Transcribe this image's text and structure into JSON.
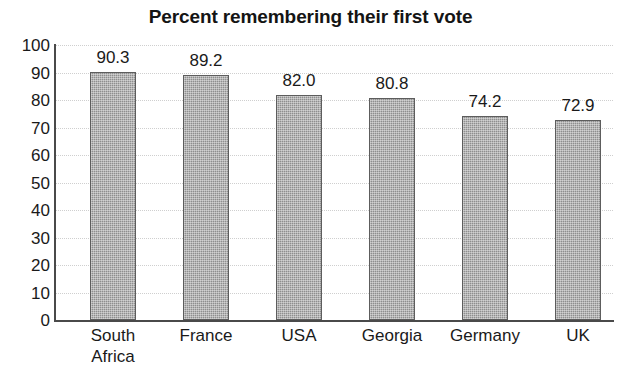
{
  "chart_data": {
    "type": "bar",
    "title": "Percent remembering their first vote",
    "xlabel": "",
    "ylabel": "",
    "ylim": [
      0,
      100
    ],
    "ytick_step": 10,
    "yticks": [
      "100",
      "90",
      "80",
      "70",
      "60",
      "50",
      "40",
      "30",
      "20",
      "10",
      "0"
    ],
    "grid": true,
    "legend": "none",
    "categories": [
      "South\nAfrica",
      "France",
      "USA",
      "Georgia",
      "Germany",
      "UK"
    ],
    "values": [
      90.3,
      89.2,
      82.0,
      80.8,
      74.2,
      72.9
    ],
    "value_labels": [
      "90.3",
      "89.2",
      "82.0",
      "80.8",
      "74.2",
      "72.9"
    ],
    "bar_fill_color": "#8f8f8f",
    "bar_edge_color": "#5d5d5d",
    "axis_color": "#4a4a4a",
    "gridline_color": "#cfcfcf",
    "background_color": "#ffffff",
    "text_color": "#1a1a1a"
  }
}
